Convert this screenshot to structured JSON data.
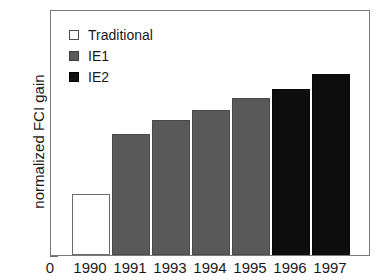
{
  "chart_data": {
    "type": "bar",
    "title": "",
    "subtitle": "",
    "xlabel": "",
    "ylabel": "normalized FCI gain",
    "categories": [
      "1990",
      "1991",
      "1993",
      "1994",
      "1995",
      "1996",
      "1997"
    ],
    "values": [
      0.25,
      0.49,
      0.55,
      0.59,
      0.64,
      0.675,
      0.735
    ],
    "series": [
      {
        "name": "Traditional",
        "points": [
          {
            "category": "1990",
            "value": 0.25,
            "group": "Traditional"
          }
        ]
      },
      {
        "name": "IE1",
        "points": [
          {
            "category": "1991",
            "value": 0.49,
            "group": "IE1"
          },
          {
            "category": "1993",
            "value": 0.55,
            "group": "IE1"
          },
          {
            "category": "1994",
            "value": 0.59,
            "group": "IE1"
          },
          {
            "category": "1995",
            "value": 0.64,
            "group": "IE1"
          }
        ]
      },
      {
        "name": "IE2",
        "points": [
          {
            "category": "1996",
            "value": 0.675,
            "group": "IE2"
          },
          {
            "category": "1997",
            "value": 0.735,
            "group": "IE2"
          }
        ]
      }
    ],
    "bar_groups": [
      "Traditional",
      "IE1",
      "IE1",
      "IE1",
      "IE1",
      "IE2",
      "IE2"
    ],
    "ylim": [
      0,
      1
    ],
    "yticks": [
      "0",
      "0.2",
      "0.4",
      "0.6",
      "0.8",
      "1"
    ],
    "ytick_values": [
      0,
      0.2,
      0.4,
      0.6,
      0.8,
      1
    ],
    "xticks": [
      "0",
      "1990",
      "1991",
      "1993",
      "1994",
      "1995",
      "1996",
      "1997"
    ],
    "grid": false,
    "legend_position": "top-left",
    "legend": [
      {
        "label": "Traditional",
        "swatch": "white-square",
        "color": "#ffffff"
      },
      {
        "label": "IE1",
        "swatch": "gray-square",
        "color": "#595959"
      },
      {
        "label": "IE2",
        "swatch": "black-square",
        "color": "#0d0d0d"
      }
    ],
    "colors": {
      "traditional": "#ffffff",
      "ie1": "#595959",
      "ie2": "#0d0d0d",
      "axis": "#7a7a7a",
      "text": "#1a1a1a",
      "background": "#ffffff"
    }
  }
}
